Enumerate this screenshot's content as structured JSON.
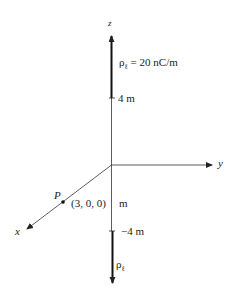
{
  "diagram": {
    "axes": {
      "z_label": "z",
      "y_label": "y",
      "x_label": "x"
    },
    "upper_line": {
      "charge_label": "ρ",
      "charge_subscript": "ℓ",
      "charge_value": "= 20 nC/m",
      "endpoint_label": "4 m"
    },
    "lower_line": {
      "charge_label": "ρ",
      "charge_subscript": "ℓ",
      "endpoint_label": "−4 m"
    },
    "gap_label": "m",
    "point": {
      "name": "P",
      "coords": "(3, 0, 0)"
    }
  }
}
